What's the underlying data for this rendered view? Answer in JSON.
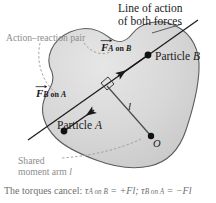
{
  "figure": {
    "background_color": "#ffffff",
    "body_fill_color": "#d5d5d5",
    "body_outline_color": "#5a5a5a",
    "leader_color": "#9a9a9a",
    "line_of_action_color": "#1a1a1a"
  },
  "annotations": {
    "line_of_action_title_1": "Line of action",
    "line_of_action_title_2": "of both forces",
    "action_reaction_pair": "Action–reaction pair",
    "shared_moment_arm_1": "Shared",
    "shared_moment_arm_2": "moment arm",
    "shared_moment_arm_symbol": "l"
  },
  "forces": {
    "f_a_on_b": {
      "symbol": "F",
      "subscript_a": "A",
      "subscript_on": " on ",
      "subscript_b": "B",
      "full": "F A on B"
    },
    "f_b_on_a": {
      "symbol": "F",
      "subscript_a": "B",
      "subscript_on": " on ",
      "subscript_b": "A",
      "full": "F B on A"
    }
  },
  "particles": {
    "particle_b_label": "Particle",
    "particle_b_name": "B",
    "particle_a_label": "Particle",
    "particle_a_name": "A"
  },
  "geometry": {
    "moment_arm_label": "l",
    "pivot_label": "O",
    "right_angle_marker": "right-angle"
  },
  "caption": {
    "text": "The torques cancel: ",
    "tau1": "τ",
    "tau1_sub": "A on B",
    "eq1": " = +Fl; ",
    "tau2": "τ",
    "tau2_sub": "B on A",
    "eq2": " = −Fl"
  }
}
